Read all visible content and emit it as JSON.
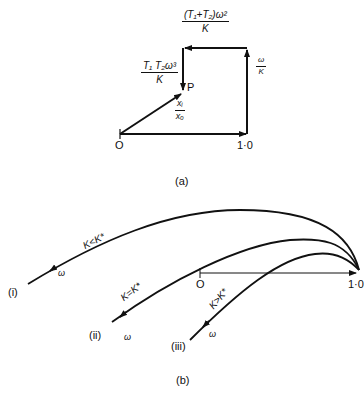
{
  "figure_a": {
    "caption": "(a)",
    "origin_label": "O",
    "unit_label": "1·0",
    "point_label": "P",
    "labels": {
      "top": {
        "num": "(T₁+T₂)ω²",
        "den": "K"
      },
      "left": {
        "num": "T₁ T₂ω³",
        "den": "K"
      },
      "right": {
        "num": "ω",
        "den": "K"
      },
      "ratio": {
        "num": "xᵢ",
        "den": "xₒ"
      }
    }
  },
  "figure_b": {
    "caption": "(b)",
    "origin_label": "O",
    "unit_label": "1·0",
    "curves": [
      {
        "id": "i",
        "marker": "(i)",
        "condition": "K<K*",
        "freq_label": "ω"
      },
      {
        "id": "ii",
        "marker": "(ii)",
        "condition": "K=K*",
        "freq_label": "ω"
      },
      {
        "id": "iii",
        "marker": "(iii)",
        "condition": "K>K*",
        "freq_label": "ω"
      }
    ]
  }
}
